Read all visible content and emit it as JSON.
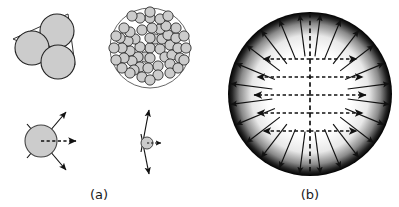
{
  "figure": {
    "background_color": "#ffffff",
    "width": 399,
    "height": 207,
    "panels": [
      {
        "id": "a",
        "caption": "(a)",
        "caption_x": 99,
        "caption_y": 199,
        "description": "particle aggregates with surface tension force vectors"
      },
      {
        "id": "b",
        "caption": "(b)",
        "caption_x": 310,
        "caption_y": 199,
        "description": "shaded sphere with outward radial arrows, vertical dashed axis and five horizontal dashed double arrows"
      }
    ]
  },
  "colors": {
    "particle_fill": "#cccccc",
    "particle_stroke": "#222222",
    "arrow_color": "#111111",
    "dashed_color": "#111111",
    "caption_color": "#1a1a1a",
    "sphere_rim": "#000000",
    "sphere_core": "#ffffff"
  },
  "panel_a": {
    "trimer": {
      "label": "three-particle cluster",
      "center_x": 47,
      "center_y": 46,
      "circle_radius": 17,
      "circles": [
        {
          "cx": 57,
          "cy": 31,
          "r": 17
        },
        {
          "cx": 32,
          "cy": 48,
          "r": 17
        },
        {
          "cx": 58,
          "cy": 62,
          "r": 17
        }
      ],
      "hull_points": "13,39 68,14 75,65"
    },
    "aggregate": {
      "label": "many-particle aggregate",
      "center_x": 150,
      "center_y": 48,
      "outer_radius": 40,
      "particle_radius": 5.1,
      "particle_count": 58,
      "particles": [
        [
          150,
          48
        ],
        [
          160,
          49
        ],
        [
          140,
          47
        ],
        [
          155,
          39
        ],
        [
          145,
          57
        ],
        [
          162,
          39
        ],
        [
          138,
          57
        ],
        [
          150,
          58
        ],
        [
          150,
          38
        ],
        [
          170,
          45
        ],
        [
          130,
          51
        ],
        [
          165,
          57
        ],
        [
          135,
          39
        ],
        [
          158,
          66
        ],
        [
          142,
          30
        ],
        [
          168,
          35
        ],
        [
          132,
          61
        ],
        [
          172,
          55
        ],
        [
          128,
          41
        ],
        [
          160,
          29
        ],
        [
          140,
          67
        ],
        [
          152,
          28
        ],
        [
          148,
          68
        ],
        [
          178,
          48
        ],
        [
          122,
          48
        ],
        [
          170,
          64
        ],
        [
          130,
          32
        ],
        [
          166,
          26
        ],
        [
          134,
          70
        ],
        [
          176,
          38
        ],
        [
          124,
          58
        ],
        [
          158,
          75
        ],
        [
          142,
          77
        ],
        [
          180,
          58
        ],
        [
          120,
          38
        ],
        [
          150,
          18
        ],
        [
          160,
          19
        ],
        [
          140,
          18
        ],
        [
          170,
          73
        ],
        [
          130,
          73
        ],
        [
          186,
          48
        ],
        [
          114,
          48
        ],
        [
          176,
          28
        ],
        [
          124,
          28
        ],
        [
          178,
          68
        ],
        [
          122,
          68
        ],
        [
          168,
          16
        ],
        [
          132,
          16
        ],
        [
          184,
          60
        ],
        [
          116,
          60
        ],
        [
          184,
          36
        ],
        [
          116,
          36
        ],
        [
          150,
          80
        ],
        [
          150,
          12
        ],
        [
          158,
          11
        ],
        [
          142,
          11
        ],
        [
          159,
          85
        ],
        [
          141,
          85
        ]
      ]
    },
    "force_large": {
      "label": "large particle with diverging force arrows",
      "circle_cx": 41,
      "circle_cy": 141,
      "circle_r": 16,
      "dashed_arrow": {
        "x1": 41,
        "y1": 141,
        "x2": 78,
        "y2": 141
      },
      "arrow_up": {
        "x1": 27,
        "y1": 158,
        "x2": 66,
        "y2": 112
      },
      "arrow_down": {
        "x1": 27,
        "y1": 124,
        "x2": 66,
        "y2": 170
      }
    },
    "force_small": {
      "label": "small particle with nearly tangential force arrows",
      "circle_cx": 147,
      "circle_cy": 143,
      "circle_r": 6,
      "dashed_arrow": {
        "x1": 147,
        "y1": 143,
        "x2": 162,
        "y2": 143
      },
      "arrow_up": {
        "x1": 141,
        "y1": 152,
        "x2": 149,
        "y2": 108
      },
      "arrow_down": {
        "x1": 141,
        "y1": 134,
        "x2": 149,
        "y2": 176
      }
    }
  },
  "panel_b": {
    "sphere": {
      "label": "shaded sphere",
      "cx": 310,
      "cy": 94,
      "r": 82,
      "gradient_stops": [
        {
          "offset": "0%",
          "color": "#ffffff"
        },
        {
          "offset": "52%",
          "color": "#ffffff"
        },
        {
          "offset": "72%",
          "color": "#e8e8e8"
        },
        {
          "offset": "86%",
          "color": "#8a8a8a"
        },
        {
          "offset": "95%",
          "color": "#242424"
        },
        {
          "offset": "100%",
          "color": "#000000"
        }
      ]
    },
    "radial_arrows": {
      "label": "outward radial arrows",
      "count": 24,
      "inner_radius": 38,
      "outer_radius": 80
    },
    "center_axis": {
      "label": "vertical dashed symmetry axis",
      "x": 310,
      "y1": 13,
      "y2": 175
    },
    "horizontal_arrows": {
      "label": "horizontal dashed double-headed arrows",
      "rows": [
        {
          "y": 59,
          "half_length": 47
        },
        {
          "y": 77,
          "half_length": 53
        },
        {
          "y": 95,
          "half_length": 56
        },
        {
          "y": 113,
          "half_length": 53
        },
        {
          "y": 131,
          "half_length": 47
        }
      ]
    }
  }
}
